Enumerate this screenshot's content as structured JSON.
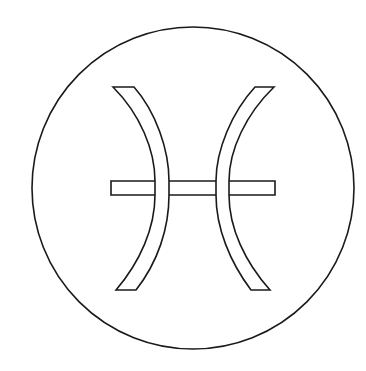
{
  "icon": {
    "name": "pisces-zodiac-symbol",
    "label": "Pisces",
    "stroke_color": "#1a1a1a",
    "fill_color": "#ffffff",
    "background": "#ffffff"
  }
}
